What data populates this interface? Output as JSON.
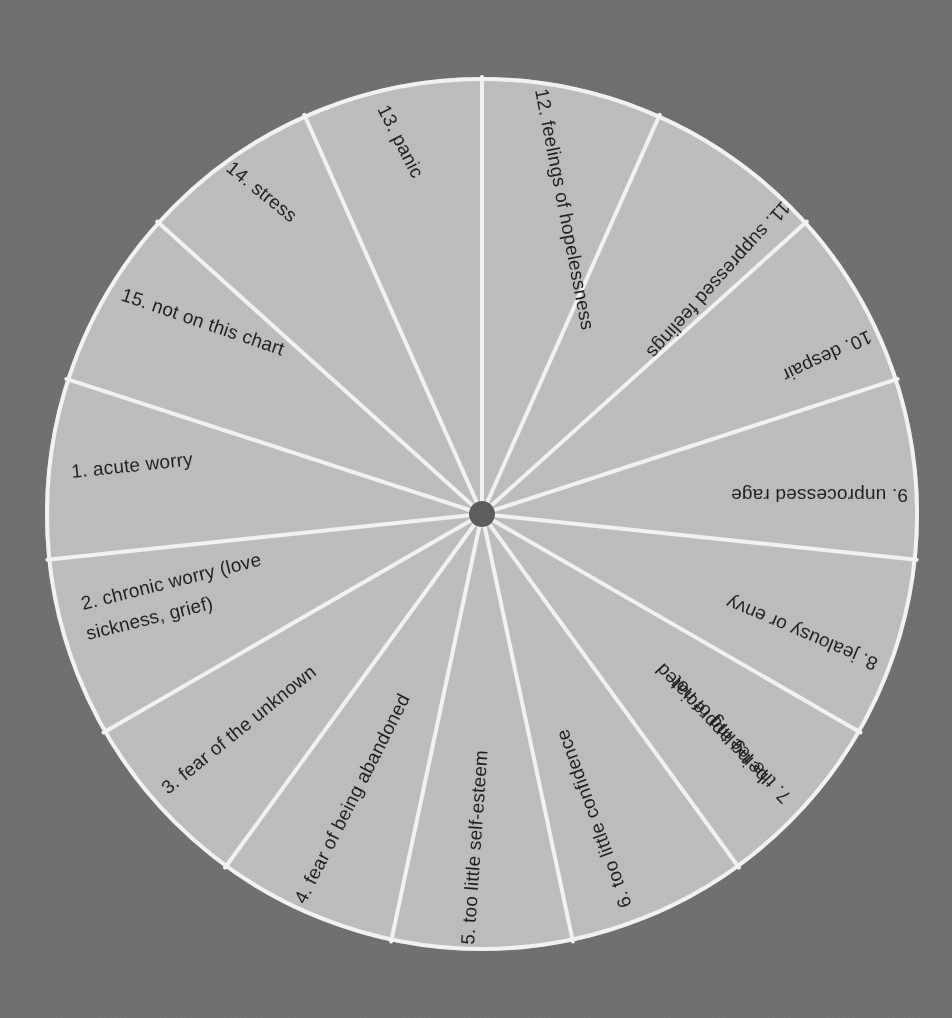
{
  "chart_data": {
    "type": "pie",
    "title": "",
    "subtitle": "",
    "xlabel": "",
    "ylabel": "",
    "legend_position": "none",
    "grid": false,
    "equal_slices": true,
    "slice_count": 15,
    "values": [
      1,
      1,
      1,
      1,
      1,
      1,
      1,
      1,
      1,
      1,
      1,
      1,
      1,
      1,
      1
    ],
    "categories": [
      "1. acute worry",
      "2. chronic worry (love sickness, grief)",
      "3. fear of the unknown",
      "4. fear of being abandoned",
      "5. too little self-esteem",
      "6. too little confidence",
      "7. the feeling of not being appreciated",
      "8. jealousy or envy",
      "9. unprocessed rage",
      "10. despair",
      "11. suppressed feelings",
      "12. feelings of hopelessness",
      "13. panic",
      "14. stress",
      "15. not on this chart"
    ],
    "slices": [
      {
        "number": "1.",
        "label": "acute worry",
        "lines": [
          "1.  acute worry"
        ]
      },
      {
        "number": "2.",
        "label": "chronic worry (love sickness, grief)",
        "lines": [
          "2.  chronic worry (love",
          "sickness, grief)"
        ]
      },
      {
        "number": "3.",
        "label": "fear of the unknown",
        "lines": [
          "3.  fear of the unknown"
        ]
      },
      {
        "number": "4.",
        "label": "fear of being abandoned",
        "lines": [
          "4.  fear of being abandoned"
        ]
      },
      {
        "number": "5.",
        "label": "too little self-esteem",
        "lines": [
          "5.  too little self-esteem"
        ]
      },
      {
        "number": "6.",
        "label": "too little confidence",
        "lines": [
          "6.  too little confidence"
        ]
      },
      {
        "number": "7.",
        "label": "the feeling of not being appreciated",
        "lines": [
          "7.  the feeling of not",
          "being appreciated"
        ]
      },
      {
        "number": "8.",
        "label": "jealousy or envy",
        "lines": [
          "8.  jealousy or envy"
        ]
      },
      {
        "number": "9.",
        "label": "unprocessed rage",
        "lines": [
          "9.  unprocessed rage"
        ]
      },
      {
        "number": "10.",
        "label": "despair",
        "lines": [
          "10.  despair"
        ]
      },
      {
        "number": "11.",
        "label": "suppressed feelings",
        "lines": [
          "11.  suppressed feelings"
        ]
      },
      {
        "number": "12.",
        "label": "feelings of hopelessness",
        "lines": [
          "12. feelings of hopelessness"
        ]
      },
      {
        "number": "13.",
        "label": "panic",
        "lines": [
          "13. panic"
        ]
      },
      {
        "number": "14.",
        "label": "stress",
        "lines": [
          "14.  stress"
        ]
      },
      {
        "number": "15.",
        "label": "not on this chart",
        "lines": [
          "15.  not on this chart"
        ]
      }
    ]
  },
  "colors": {
    "background": "#6f6f70",
    "sector_fill": "#bcbcbc",
    "divider": "#f2f2f0",
    "hub": "#5d5d5f",
    "text": "#1f1f22"
  },
  "geometry": {
    "center_x": 482,
    "center_y": 514,
    "radius": 437,
    "hub_radius": 13
  },
  "labels": {
    "s1_line1": "1.  acute worry",
    "s2_line1": "2.  chronic worry (love",
    "s2_line2": "sickness, grief)",
    "s3_line1": "3.  fear of the unknown",
    "s4_line1": "4.  fear of being abandoned",
    "s5_line1": "5.  too little self-esteem",
    "s6_line1": "6.  too little confidence",
    "s7_line1": "7.  the feeling of not",
    "s7_line2": "being appreciated",
    "s8_line1": "8.  jealousy or envy",
    "s9_line1": "9.  unprocessed rage",
    "s10_line1": "10.  despair",
    "s11_line1": "11.  suppressed feelings",
    "s12_line1": "12. feelings of hopelessness",
    "s13_line1": "13. panic",
    "s14_line1": "14.  stress",
    "s15_line1": "15.  not on this chart"
  }
}
